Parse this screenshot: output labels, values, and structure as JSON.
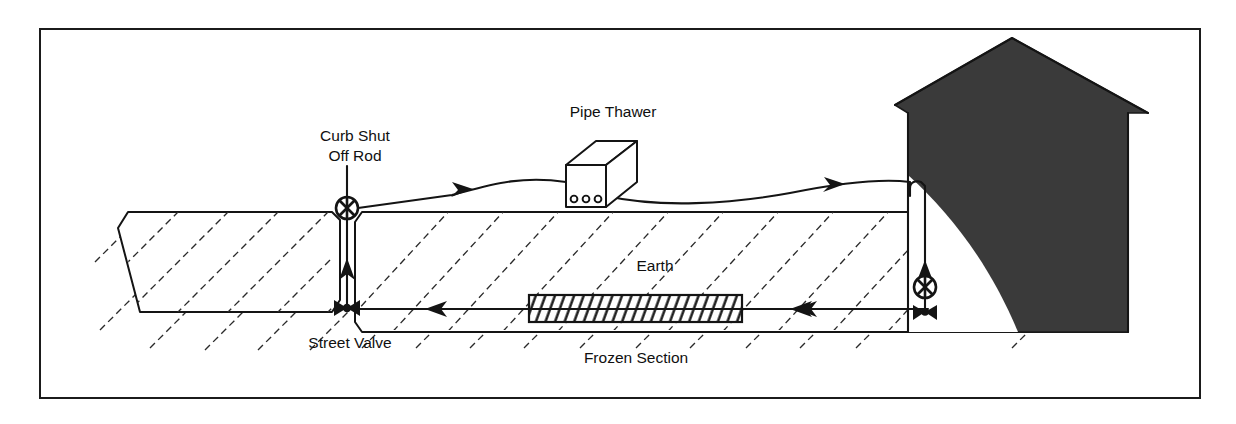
{
  "figure": {
    "type": "technical-cross-section-diagram",
    "canvas": {
      "width": 1236,
      "height": 424
    },
    "border": {
      "x": 40,
      "y": 29,
      "width": 1160,
      "height": 369,
      "color": "#1b1b1b"
    }
  },
  "labels": {
    "curb_shut_off_rod_line1": "Curb Shut",
    "curb_shut_off_rod_line2": "Off Rod",
    "pipe_thawer": "Pipe Thawer",
    "earth": "Earth",
    "street_valve": "Street Valve",
    "frozen_section": "Frozen Section"
  },
  "components": {
    "roadway": {
      "name": "street-roadway-cross-section",
      "description": "trapezoidal street cross-section at left with diagonal hatching"
    },
    "earth_ground": {
      "name": "earth-ground-mass",
      "surface_y": 212,
      "description": "hatched earth region right of the street trench"
    },
    "curb_stop_valve": {
      "name": "curb-shut-off-valve",
      "symbol": "circle-with-cross",
      "cx": 347,
      "cy": 208,
      "r": 11
    },
    "street_valve_symbol": {
      "name": "street-gate-valve",
      "symbol": "bowtie-gate-valve",
      "cx": 347,
      "cy": 308
    },
    "house_valve": {
      "name": "house-shut-off-valve",
      "symbol": "circle-with-cross",
      "cx": 925,
      "cy": 287,
      "r": 11
    },
    "house_gate_valve": {
      "name": "house-basement-gate-valve",
      "symbol": "bowtie-gate-valve",
      "cx": 925,
      "cy": 312
    },
    "pipe_thawer_unit": {
      "name": "pipe-thawer-machine",
      "shape": "isometric-box",
      "front_face": {
        "x": 566,
        "y": 165,
        "w": 40,
        "h": 42
      },
      "connector_count": 3,
      "connector_label": "terminal-ports"
    },
    "frozen_section_block": {
      "name": "frozen-pipe-section",
      "x": 529,
      "y": 295,
      "width": 213,
      "height": 27,
      "pattern": "dense-diagonal-hatch"
    },
    "house": {
      "name": "house-silhouette",
      "fill": "#3a3a3a",
      "description": "dark filled house with peaked roof and curved white cutout"
    }
  },
  "flow": {
    "supply_hose_direction": "right",
    "supply_hose_arrows": 2,
    "riser_arrow_direction": "up",
    "house_drop_arrow_direction": "down",
    "buried_line_arrows": 3,
    "buried_line_direction": "left"
  },
  "colors": {
    "ink": "#141414",
    "hatch": "#2a2a2a",
    "house_fill": "#3a3a3a",
    "paper": "#ffffff"
  }
}
